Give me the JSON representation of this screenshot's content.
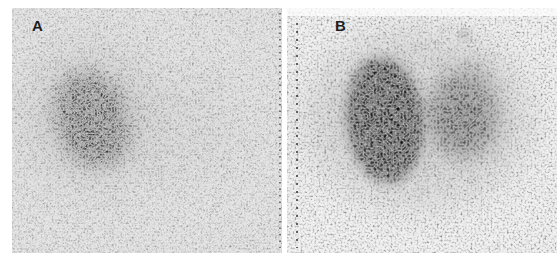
{
  "figure": {
    "panels": [
      {
        "label": "A",
        "description": "Grainy grayscale scan with a single dark oval uptake region on the left side"
      },
      {
        "label": "B",
        "description": "Grainy grayscale scan with a large very dark oval region and a second smaller dark region to its right"
      }
    ],
    "colors": {
      "background": "#ffffff",
      "panel_a_base": "#c9c9c9",
      "panel_b_base": "#e4e4e4",
      "uptake_dark": "#1a1a1a"
    }
  }
}
